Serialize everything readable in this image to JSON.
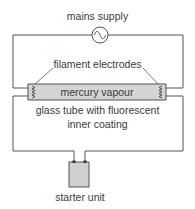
{
  "labels": {
    "mains_supply": "mains supply",
    "filament_electrodes": "filament electrodes",
    "mercury_vapour": "mercury vapour",
    "glass_tube_line1": "glass tube with fluorescent",
    "glass_tube_line2": "inner coating",
    "starter_unit": "starter unit"
  },
  "colors": {
    "wire": "#555555",
    "tube_fill": "#d4d4d4",
    "starter_fill": "#cfcfcf"
  },
  "icons": {
    "ac_source": "sine-wave-in-circle",
    "electrode": "coil-zigzag"
  }
}
